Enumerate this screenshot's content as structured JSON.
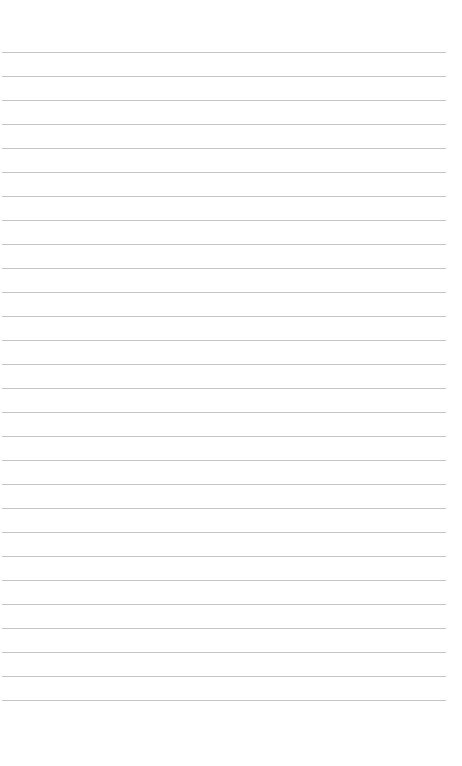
{
  "page": {
    "type": "lined-paper",
    "background": "#ffffff",
    "rule_color": "#c4c4c4",
    "rule_count": 28,
    "first_rule_y": 52,
    "rule_spacing": 24,
    "rule_left": 2,
    "rule_width": 444
  }
}
